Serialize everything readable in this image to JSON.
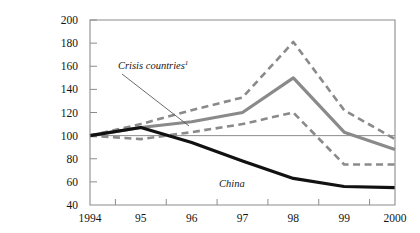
{
  "figure": {
    "background_color": "#ffffff",
    "plot_border_color": "#8c8c8c",
    "zero_reference_label": "100",
    "partial_top_caption": ""
  },
  "annotations": [
    {
      "id": "crisis",
      "text": "Crisis countries",
      "footnote_marker": "1",
      "x": 118,
      "y": 69,
      "leader": {
        "x1": 122,
        "y1": 74,
        "x2": 189,
        "y2": 126
      }
    },
    {
      "id": "china",
      "text": "China",
      "footnote_marker": "",
      "x": 219,
      "y": 187,
      "leader": null
    }
  ],
  "chart_data": {
    "type": "line",
    "title": "",
    "subtitle": "",
    "xlabel": "",
    "ylabel": "",
    "x": [
      1994,
      1995,
      1996,
      1997,
      1998,
      1999,
      2000
    ],
    "categories": [
      "1994",
      "95",
      "96",
      "97",
      "98",
      "99",
      "2000"
    ],
    "xlim": [
      1994,
      2000
    ],
    "ylim": [
      40,
      200
    ],
    "yticks": [
      40,
      60,
      80,
      100,
      120,
      140,
      160,
      180,
      200
    ],
    "ytick_labels": [
      "40",
      "60",
      "80",
      "100",
      "120",
      "140",
      "160",
      "180",
      "200"
    ],
    "grid": false,
    "reference_line": 100,
    "legend": "none",
    "series": [
      {
        "name": "Crisis countries upper band",
        "values": [
          100,
          110,
          122,
          133,
          181,
          122,
          97
        ],
        "color": "#8a8a8a",
        "style": "dashed",
        "width": 2.6
      },
      {
        "name": "Crisis countries",
        "values": [
          100,
          107,
          112,
          120,
          150,
          103,
          88
        ],
        "color": "#8a8a8a",
        "style": "solid",
        "width": 3.2
      },
      {
        "name": "Crisis countries lower band",
        "values": [
          100,
          97,
          103,
          110,
          120,
          75,
          75
        ],
        "color": "#8a8a8a",
        "style": "dashed",
        "width": 2.6
      },
      {
        "name": "China",
        "values": [
          100,
          107,
          94,
          78,
          63,
          56,
          55
        ],
        "color": "#111111",
        "style": "solid",
        "width": 3.2
      }
    ]
  }
}
